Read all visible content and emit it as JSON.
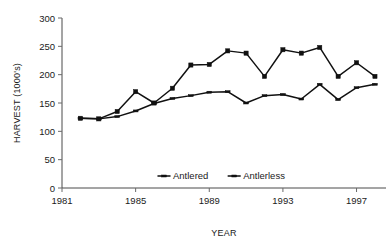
{
  "chart_data": {
    "type": "line",
    "title": "",
    "xlabel": "YEAR",
    "ylabel": "HARVEST (1000's)",
    "xlim": [
      1981,
      1998.6
    ],
    "ylim": [
      0,
      300
    ],
    "ytick_labels": [
      "0",
      "50",
      "100",
      "150",
      "200",
      "250",
      "300"
    ],
    "ytick_values": [
      0,
      50,
      100,
      150,
      200,
      250,
      300
    ],
    "xtick_labels": [
      "1981",
      "1985",
      "1989",
      "1993",
      "1997"
    ],
    "xtick_values": [
      1981,
      1985,
      1989,
      1993,
      1997
    ],
    "grid": false,
    "legend_position": "inside-bottom-center",
    "x": [
      1982,
      1983,
      1984,
      1985,
      1986,
      1987,
      1988,
      1989,
      1990,
      1991,
      1992,
      1993,
      1994,
      1995,
      1996,
      1997,
      1998
    ],
    "series": [
      {
        "name": "Antlered",
        "marker": "tick",
        "color": "#111111",
        "values": [
          123,
          122,
          126,
          136,
          149,
          158,
          163,
          169,
          170,
          150,
          163,
          165,
          157,
          183,
          156,
          177,
          183
        ]
      },
      {
        "name": "Antlerless",
        "marker": "square",
        "color": "#111111",
        "values": [
          123,
          122,
          135,
          170,
          150,
          176,
          217,
          218,
          242,
          238,
          197,
          244,
          238,
          248,
          197,
          221,
          197
        ]
      }
    ]
  },
  "legend": {
    "entries": [
      {
        "label": "Antlered",
        "marker": "tick-marker"
      },
      {
        "label": "Antlerless",
        "marker": "square-marker"
      }
    ]
  },
  "axes": {
    "y_title": "HARVEST (1000's)",
    "x_title": "YEAR"
  }
}
